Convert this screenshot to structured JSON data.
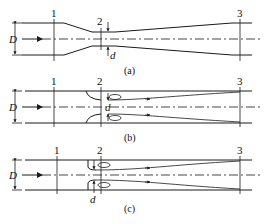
{
  "figure": {
    "panels": [
      {
        "id": "a",
        "caption": "(a)",
        "type": "venturi",
        "section_labels": [
          "1",
          "2",
          "3"
        ],
        "dimension_labels": {
          "pipe": "D",
          "throat": "d"
        }
      },
      {
        "id": "b",
        "caption": "(b)",
        "type": "nozzle",
        "section_labels": [
          "1",
          "2",
          "3"
        ],
        "dimension_labels": {
          "pipe": "D",
          "throat": "d"
        }
      },
      {
        "id": "c",
        "caption": "(c)",
        "type": "orifice",
        "section_labels": [
          "1",
          "2",
          "3"
        ],
        "dimension_labels": {
          "pipe": "D",
          "throat": "d"
        }
      }
    ],
    "colors": {
      "line": "#1a1a1a",
      "background": "#ffffff"
    }
  }
}
